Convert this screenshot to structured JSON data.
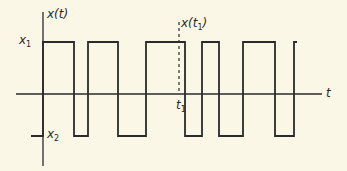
{
  "diagram": {
    "colors": {
      "background": "#fbf7e6",
      "line": "#2a2a2a"
    },
    "labels": {
      "y_axis": "x(t)",
      "x_axis": "t",
      "level_high": "x",
      "level_high_sub": "1",
      "level_low": "x",
      "level_low_sub": "2",
      "sample_top": "x(t",
      "sample_top_sub": "1",
      "sample_top_close": ")",
      "sample_time": "t",
      "sample_time_sub": "1"
    },
    "geometry": {
      "y_axis_x": 43,
      "y_axis_range": [
        12,
        166
      ],
      "x_axis_y": 94,
      "x_axis_range": [
        16,
        322
      ],
      "high_y": 42,
      "low_y": 136,
      "sample_x": 179,
      "sample_range": [
        22,
        94
      ],
      "waveform_points": [
        [
          31,
          136
        ],
        [
          43,
          136
        ],
        [
          43,
          42
        ],
        [
          74,
          42
        ],
        [
          74,
          136
        ],
        [
          88,
          136
        ],
        [
          88,
          42
        ],
        [
          118,
          42
        ],
        [
          118,
          136
        ],
        [
          146,
          136
        ],
        [
          146,
          42
        ],
        [
          185,
          42
        ],
        [
          185,
          136
        ],
        [
          202,
          136
        ],
        [
          202,
          42
        ],
        [
          219,
          42
        ],
        [
          219,
          136
        ],
        [
          243,
          136
        ],
        [
          243,
          42
        ],
        [
          275,
          42
        ],
        [
          275,
          136
        ],
        [
          294,
          136
        ],
        [
          294,
          42
        ],
        [
          297,
          42
        ]
      ]
    }
  }
}
